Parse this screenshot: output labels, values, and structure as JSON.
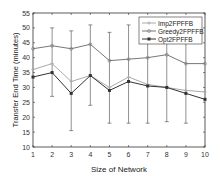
{
  "chart_data": {
    "type": "line",
    "title": "",
    "xlabel": "Size of Network",
    "ylabel": "Transfer End Time (minutes)",
    "xlim": [
      1,
      10
    ],
    "ylim": [
      10,
      55
    ],
    "xticks": [
      1,
      2,
      3,
      4,
      5,
      6,
      7,
      8,
      9,
      10
    ],
    "yticks": [
      10,
      15,
      20,
      25,
      30,
      35,
      40,
      45,
      50,
      55
    ],
    "grid": false,
    "legend_position": "upper right",
    "x": [
      1,
      2,
      3,
      4,
      5,
      6,
      7,
      8,
      9,
      10
    ],
    "series": [
      {
        "name": "Imp2FPFFB",
        "color": "#aaaaaa",
        "marker": "+",
        "values": [
          36,
          38,
          32,
          34,
          30,
          33.5,
          31,
          30,
          29,
          28.5
        ]
      },
      {
        "name": "Greedy2FPFFB",
        "color": "#777777",
        "marker": "o",
        "values": [
          43,
          44,
          43,
          44.5,
          39,
          39.5,
          40,
          41,
          38,
          38
        ]
      },
      {
        "name": "Opt2FPFFB",
        "color": "#333333",
        "marker": "s",
        "values": [
          33.5,
          35,
          28,
          34,
          29,
          32,
          30.5,
          30,
          28,
          26
        ]
      }
    ],
    "error_bars": {
      "lower": [
        null,
        27,
        15.5,
        24,
        18,
        18,
        18,
        18.5,
        18,
        null
      ],
      "upper": [
        null,
        50,
        49,
        51,
        48.5,
        51,
        50.5,
        51,
        49,
        null
      ]
    }
  }
}
